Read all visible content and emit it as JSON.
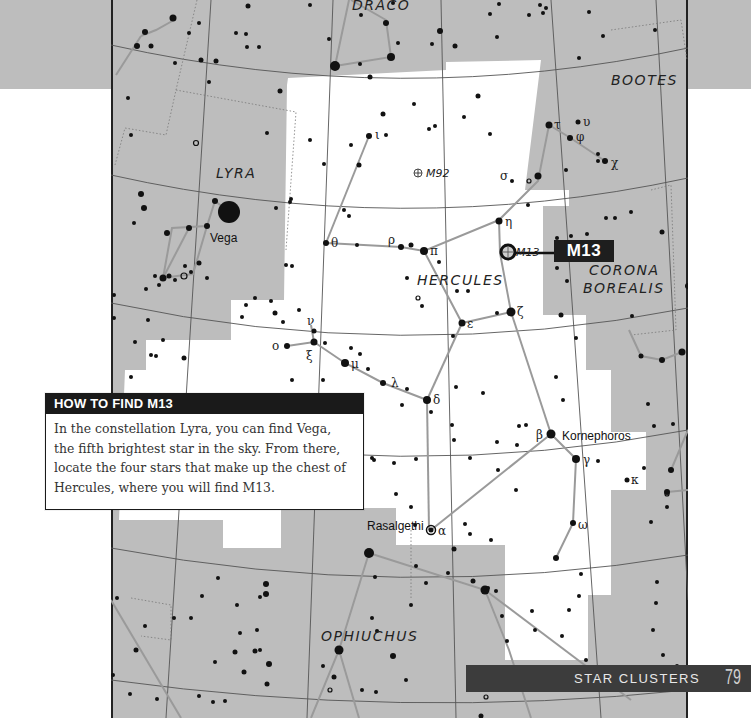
{
  "chart": {
    "constellations": [
      {
        "name": "DRACO",
        "x": 241,
        "y": 10
      },
      {
        "name": "BOOTES",
        "x": 500,
        "y": 85
      },
      {
        "name": "LYRA",
        "x": 105,
        "y": 178
      },
      {
        "name": "HERCULES",
        "x": 306,
        "y": 285
      },
      {
        "name": "CORONA",
        "x": 480,
        "y": 274
      },
      {
        "name": "BOREALIS",
        "x": 475,
        "y": 292
      },
      {
        "name": "OPHIUCHUS",
        "x": 210,
        "y": 641
      }
    ],
    "named_stars": [
      {
        "name": "Vega",
        "x": 117,
        "y": 238
      },
      {
        "name": "Kornephoros",
        "x": 450,
        "y": 440
      },
      {
        "name": "Rasalgethi",
        "x": 254,
        "y": 526
      }
    ],
    "greek_labels": [
      {
        "letter": "ι",
        "x": 264,
        "y": 137
      },
      {
        "letter": "τ",
        "x": 444,
        "y": 128
      },
      {
        "letter": "υ",
        "x": 474,
        "y": 126
      },
      {
        "letter": "φ",
        "x": 466,
        "y": 140
      },
      {
        "letter": "χ",
        "x": 505,
        "y": 167
      },
      {
        "letter": "σ",
        "x": 388,
        "y": 179
      },
      {
        "letter": "η",
        "x": 396,
        "y": 226
      },
      {
        "letter": "ρ",
        "x": 278,
        "y": 243
      },
      {
        "letter": "π",
        "x": 318,
        "y": 255
      },
      {
        "letter": "θ",
        "x": 219,
        "y": 247
      },
      {
        "letter": "ζ",
        "x": 406,
        "y": 316
      },
      {
        "letter": "ε",
        "x": 357,
        "y": 328
      },
      {
        "letter": "ν",
        "x": 197,
        "y": 323
      },
      {
        "letter": "ο",
        "x": 163,
        "y": 349
      },
      {
        "letter": "ξ",
        "x": 195,
        "y": 358
      },
      {
        "letter": "μ",
        "x": 240,
        "y": 368
      },
      {
        "letter": "λ",
        "x": 282,
        "y": 387
      },
      {
        "letter": "δ",
        "x": 323,
        "y": 405
      },
      {
        "letter": "β",
        "x": 424,
        "y": 440
      },
      {
        "letter": "γ",
        "x": 476,
        "y": 464
      },
      {
        "letter": "κ",
        "x": 517,
        "y": 484
      },
      {
        "letter": "ω",
        "x": 471,
        "y": 529
      },
      {
        "letter": "α",
        "x": 325,
        "y": 534
      }
    ],
    "deep_sky_objects": [
      {
        "name": "M92",
        "x": 313,
        "y": 173
      }
    ],
    "callout": {
      "label": "M13",
      "small_label": "M13"
    }
  },
  "info_box": {
    "title": "HOW TO FIND M13",
    "body": "In the constellation Lyra, you can find Vega, the fifth brightest star in the sky. From there, locate the four stars that make up the chest of Hercules, where you will find M13."
  },
  "footer": {
    "section": "STAR CLUSTERS",
    "page_number": "79"
  },
  "colors": {
    "sky_shade": "#bdbdbd",
    "highlight": "#ffffff",
    "ink": "#111111",
    "stick_line": "#9a9a9a",
    "footer_band": "#3c3c3c"
  }
}
